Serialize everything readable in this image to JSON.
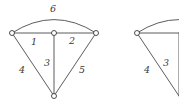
{
  "figure": {
    "background_color": "#ffffff",
    "stroke_color": "#4a4a4a",
    "label_color": "#3a3a3a",
    "vertex_fill": "#ffffff",
    "width": 179,
    "height": 105
  },
  "graphs": [
    {
      "name": "left-fan-graph",
      "vertices": [
        {
          "id": "left",
          "x": 12,
          "y": 33
        },
        {
          "id": "middle",
          "x": 54,
          "y": 33
        },
        {
          "id": "right",
          "x": 96,
          "y": 33
        },
        {
          "id": "apex",
          "x": 54,
          "y": 96
        }
      ],
      "edges": [
        {
          "label": "1",
          "from": "left",
          "to": "middle",
          "shape": "line",
          "label_x": 34,
          "label_y": 42
        },
        {
          "label": "2",
          "from": "middle",
          "to": "right",
          "shape": "line",
          "label_x": 72,
          "label_y": 41
        },
        {
          "label": "3",
          "from": "middle",
          "to": "apex",
          "shape": "line",
          "label_x": 47,
          "label_y": 63
        },
        {
          "label": "4",
          "from": "left",
          "to": "apex",
          "shape": "line",
          "label_x": 22,
          "label_y": 70
        },
        {
          "label": "5",
          "from": "right",
          "to": "apex",
          "shape": "line",
          "label_x": 82,
          "label_y": 70
        },
        {
          "label": "6",
          "from": "left",
          "to": "right",
          "shape": "arc",
          "label_x": 53,
          "label_y": 9
        }
      ]
    },
    {
      "name": "right-fan-graph-cropped",
      "vertices": [
        {
          "id": "left",
          "x": 137,
          "y": 33
        }
      ],
      "edges": [
        {
          "label": "4",
          "from": "left",
          "to": "apex",
          "shape": "line",
          "label_x": 147,
          "label_y": 70
        },
        {
          "label": "3",
          "from": "middle",
          "to": "apex",
          "shape": "line",
          "label_x": 166,
          "label_y": 63
        }
      ]
    }
  ]
}
